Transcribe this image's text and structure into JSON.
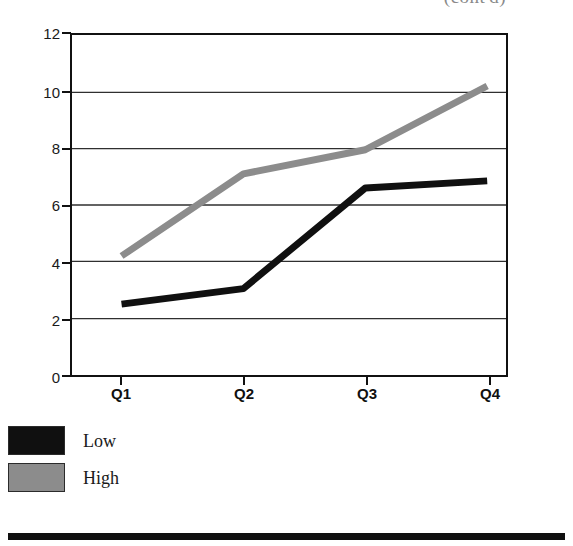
{
  "figure": {
    "clipped_caption": "(cont'd)",
    "background_color": "#ffffff"
  },
  "legend": {
    "position": "below-plot-left",
    "items": [
      {
        "label": "Low",
        "color": "#101010",
        "swatch_name": "legend-swatch-low"
      },
      {
        "label": "High",
        "color": "#8c8c8c",
        "swatch_name": "legend-swatch-high"
      }
    ]
  },
  "axes": {
    "y_ticks": [
      "12",
      "10",
      "8",
      "6",
      "4",
      "2",
      "0"
    ],
    "x_ticks": [
      "Q1",
      "Q2",
      "Q3",
      "Q4"
    ]
  },
  "chart_data": {
    "type": "line",
    "title": "",
    "xlabel": "",
    "ylabel": "",
    "categories": [
      "Q1",
      "Q2",
      "Q3",
      "Q4"
    ],
    "ylim": [
      0,
      12
    ],
    "ytick_values": [
      0,
      2,
      4,
      6,
      8,
      10,
      12
    ],
    "grid": "horizontal",
    "legend_position": "bottom-left",
    "series": [
      {
        "name": "Low",
        "color": "#101010",
        "values": [
          2.5,
          3.05,
          6.6,
          6.85
        ]
      },
      {
        "name": "High",
        "color": "#8c8c8c",
        "values": [
          4.2,
          7.1,
          7.95,
          10.2
        ]
      }
    ]
  }
}
